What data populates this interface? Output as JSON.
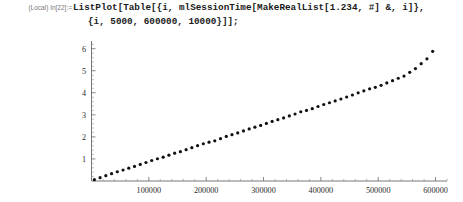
{
  "window": {
    "title": "Wolfram Mathematica Notebook",
    "background": "#ffffff"
  },
  "input_cell": {
    "prompt_label": "(Local) In[22]:=",
    "code_line_1": "ListPlot[Table[{i, mlSessionTime[MakeRealList[1.234, #] &, i]},",
    "code_line_2": "{i, 5000, 600000, 10000}]];",
    "code_color": "#1a1a1a",
    "prompt_color": "#7a7a7a"
  },
  "chart_data": {
    "type": "scatter",
    "title": "",
    "subtitle": "",
    "xlabel": "",
    "ylabel": "",
    "xlim": [
      0,
      620000
    ],
    "ylim": [
      0,
      6.35
    ],
    "grid": false,
    "legend": null,
    "marker": "point",
    "marker_color": "#111111",
    "marker_size": 1.6,
    "xticks": [
      100000,
      200000,
      300000,
      400000,
      500000,
      600000
    ],
    "xtick_labels": [
      "100000",
      "200000",
      "300000",
      "400000",
      "500000",
      "600000"
    ],
    "yticks": [
      1,
      2,
      3,
      4,
      5,
      6
    ],
    "ytick_labels": [
      "1",
      "2",
      "3",
      "4",
      "5",
      "6"
    ],
    "x_minor_tick_step": 20000,
    "y_minor_tick_step": 0.2,
    "series": [
      {
        "name": "mlSessionTime vs list length",
        "x": [
          5000,
          15000,
          25000,
          35000,
          45000,
          55000,
          65000,
          75000,
          85000,
          95000,
          105000,
          115000,
          125000,
          135000,
          145000,
          155000,
          165000,
          175000,
          185000,
          195000,
          205000,
          215000,
          225000,
          235000,
          245000,
          255000,
          265000,
          275000,
          285000,
          295000,
          305000,
          315000,
          325000,
          335000,
          345000,
          355000,
          365000,
          375000,
          385000,
          395000,
          405000,
          415000,
          425000,
          435000,
          445000,
          455000,
          465000,
          475000,
          485000,
          495000,
          505000,
          515000,
          525000,
          535000,
          545000,
          555000,
          565000,
          575000,
          585000,
          595000
        ],
        "y": [
          0.06,
          0.15,
          0.24,
          0.33,
          0.42,
          0.5,
          0.58,
          0.66,
          0.75,
          0.84,
          0.93,
          1.01,
          1.08,
          1.17,
          1.26,
          1.33,
          1.42,
          1.51,
          1.6,
          1.69,
          1.76,
          1.82,
          1.92,
          2.02,
          2.1,
          2.18,
          2.27,
          2.36,
          2.44,
          2.52,
          2.61,
          2.7,
          2.78,
          2.86,
          2.95,
          3.04,
          3.14,
          3.2,
          3.28,
          3.38,
          3.47,
          3.55,
          3.63,
          3.72,
          3.81,
          3.9,
          4.0,
          4.09,
          4.18,
          4.25,
          4.34,
          4.45,
          4.55,
          4.66,
          4.76,
          4.93,
          5.1,
          5.32,
          5.54,
          5.88
        ]
      }
    ]
  }
}
